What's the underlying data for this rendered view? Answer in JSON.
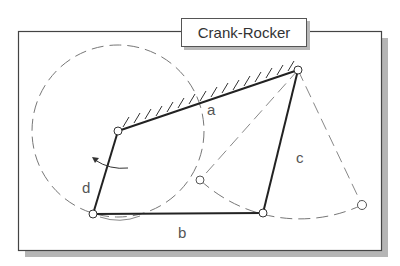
{
  "title": "Crank-Rocker",
  "labels": {
    "a": "a",
    "b": "b",
    "c": "c",
    "d": "d"
  },
  "colors": {
    "frame": "#444444",
    "shadow": "#b5b5b5",
    "link": "#222222",
    "dashed": "#777777",
    "label": "#555555"
  },
  "points": {
    "ground_left": [
      118,
      131
    ],
    "ground_right": [
      298,
      70
    ],
    "crank_bottom": [
      93,
      214
    ],
    "rocker_bottom": [
      263,
      213
    ],
    "rocker_left_extreme": [
      200,
      180
    ],
    "rocker_right_extreme": [
      362,
      205
    ]
  }
}
